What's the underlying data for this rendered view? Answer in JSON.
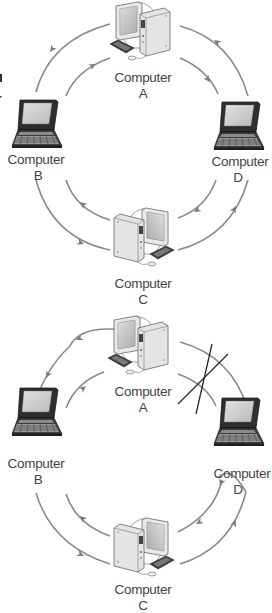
{
  "figure": {
    "colors": {
      "arrow": "#8a8a8a",
      "break_mark": "#2a2a2a",
      "label": "#444444"
    }
  },
  "diagrams": [
    {
      "id": "ring-normal",
      "nodes": [
        {
          "key": "A",
          "type": "desktop-computer",
          "name": "Computer",
          "letter": "A"
        },
        {
          "key": "B",
          "type": "laptop-computer",
          "name": "Computer",
          "letter": "B"
        },
        {
          "key": "C",
          "type": "desktop-computer",
          "name": "Computer",
          "letter": "C"
        },
        {
          "key": "D",
          "type": "laptop-computer",
          "name": "Computer",
          "letter": "D"
        }
      ],
      "links": [
        {
          "from": "A",
          "to": "B",
          "ring": "outer"
        },
        {
          "from": "B",
          "to": "A",
          "ring": "inner"
        },
        {
          "from": "A",
          "to": "D",
          "ring": "inner"
        },
        {
          "from": "D",
          "to": "A",
          "ring": "outer"
        },
        {
          "from": "B",
          "to": "C",
          "ring": "outer"
        },
        {
          "from": "C",
          "to": "B",
          "ring": "inner"
        },
        {
          "from": "D",
          "to": "C",
          "ring": "inner"
        },
        {
          "from": "C",
          "to": "D",
          "ring": "outer"
        }
      ],
      "broken_link": null
    },
    {
      "id": "ring-broken",
      "nodes": [
        {
          "key": "A",
          "type": "desktop-computer",
          "name": "Computer",
          "letter": "A"
        },
        {
          "key": "B",
          "type": "laptop-computer",
          "name": "Computer",
          "letter": "B"
        },
        {
          "key": "C",
          "type": "desktop-computer",
          "name": "Computer",
          "letter": "C"
        },
        {
          "key": "D",
          "type": "laptop-computer",
          "name": "Computer",
          "letter": "D"
        }
      ],
      "links": [
        {
          "from": "A",
          "to": "B",
          "ring": "outer"
        },
        {
          "from": "B",
          "to": "A",
          "ring": "inner"
        },
        {
          "from": "B",
          "to": "C",
          "ring": "outer"
        },
        {
          "from": "C",
          "to": "B",
          "ring": "inner"
        },
        {
          "from": "D",
          "to": "C",
          "ring": "inner"
        },
        {
          "from": "C",
          "to": "D",
          "ring": "outer"
        },
        {
          "from": "D",
          "to": "D",
          "ring": "wrap",
          "note": "traffic loops back at D"
        },
        {
          "from": "A",
          "to": "A",
          "ring": "wrap",
          "note": "traffic loops back at A"
        }
      ],
      "broken_link": {
        "between": [
          "A",
          "D"
        ],
        "mark": "X"
      }
    }
  ]
}
